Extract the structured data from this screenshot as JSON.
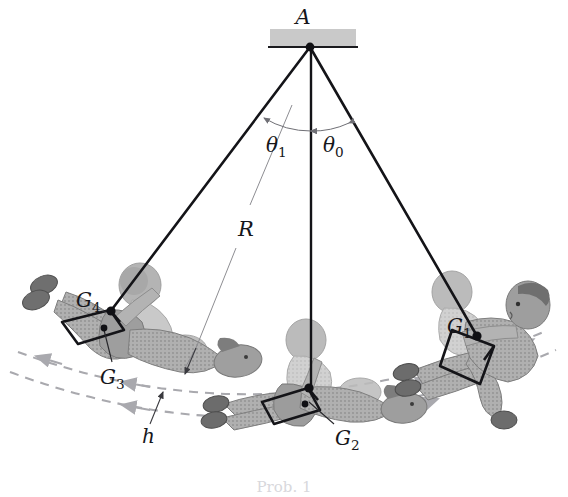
{
  "figure": {
    "caption": "Prob. 1"
  },
  "labels": {
    "pivot": "A",
    "radius": "R",
    "height": "h",
    "theta_right": "θ",
    "theta_right_sub": "0",
    "theta_left": "θ",
    "theta_left_sub": "1",
    "g1": "G",
    "g1_sub": "1",
    "g2": "G",
    "g2_sub": "2",
    "g3": "G",
    "g3_sub": "3",
    "g4": "G",
    "g4_sub": "4"
  },
  "colors": {
    "background": "#ffffff",
    "ink": "#141418",
    "rope": "#141418",
    "figure_fill": "#a9a9a9",
    "figure_fill_light": "#c4c4c4",
    "figure_shadow": "#8a8a8a",
    "dashed_arc": "#a9a9ae",
    "thin_guide": "#8d8d92",
    "support_bar": "#c9c9c9",
    "caption": "#d8d8dc"
  },
  "geometry": {
    "pivot_x": 310,
    "pivot_y": 47,
    "support_bar": {
      "x": 270,
      "y": 29,
      "width": 86,
      "height": 18
    },
    "rope_right_end": {
      "x": 477,
      "y": 333
    },
    "rope_left_end": {
      "x": 114,
      "y": 307
    },
    "rope_vertical_end": {
      "x": 311,
      "y": 384
    },
    "radius_line_end": {
      "x": 300,
      "y": 392
    },
    "cm_points": [
      {
        "name": "G1",
        "x": 477,
        "y": 333
      },
      {
        "name": "G2",
        "x": 309,
        "y": 386
      },
      {
        "name": "G2b",
        "x": 305,
        "y": 402
      },
      {
        "name": "G4",
        "x": 110,
        "y": 309
      },
      {
        "name": "G3",
        "x": 103,
        "y": 325
      }
    ],
    "theta_right_arc_angle_deg": 27,
    "theta_left_arc_angle_deg": 33
  },
  "annotations": {
    "arc_path_note": "dashed arc showing swing trajectory with direction arrowheads",
    "h_note": "vertical height between the two dashed arcs"
  }
}
